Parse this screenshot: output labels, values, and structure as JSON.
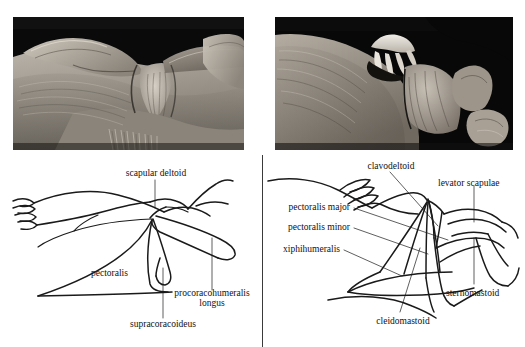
{
  "figure": {
    "caption": "",
    "panels": [
      {
        "id": "left",
        "photo_name": "cat-pectoral-region-photograph-superficial",
        "diagram_name": "cat-pectoral-region-line-drawing-left",
        "labels": [
          {
            "key": "scapular_deltoid",
            "text": "scapular deltoid"
          },
          {
            "key": "pectoralis",
            "text": "pectoralis"
          },
          {
            "key": "procoracohumeralis",
            "text": "procoracohumeralis"
          },
          {
            "key": "longus",
            "text": "longus"
          },
          {
            "key": "supracoracoideus",
            "text": "supracoracoideus"
          }
        ]
      },
      {
        "id": "right",
        "photo_name": "cat-pectoral-region-photograph-deep",
        "diagram_name": "cat-pectoral-region-line-drawing-right",
        "labels": [
          {
            "key": "clavodeltoid",
            "text": "clavodeltoid"
          },
          {
            "key": "levator_scapulae",
            "text": "levator scapulae"
          },
          {
            "key": "pectoralis_major",
            "text": "pectoralis major"
          },
          {
            "key": "pectoralis_minor",
            "text": "pectoralis minor"
          },
          {
            "key": "xiphihumeralis",
            "text": "xiphihumeralis"
          },
          {
            "key": "sternomastoid",
            "text": "sternomastoid"
          },
          {
            "key": "cleidomastoid",
            "text": "cleidomastoid"
          }
        ]
      }
    ]
  },
  "colors": {
    "page_background": "#ffffff",
    "ink": "#1a1a1a",
    "leader_line": "#4a4a4a",
    "divider": "#3a3a3a",
    "photo_background": "#000000",
    "tissue_light": "#cfc9c2",
    "tissue_mid": "#9d968d",
    "tissue_dark": "#6b655d"
  }
}
